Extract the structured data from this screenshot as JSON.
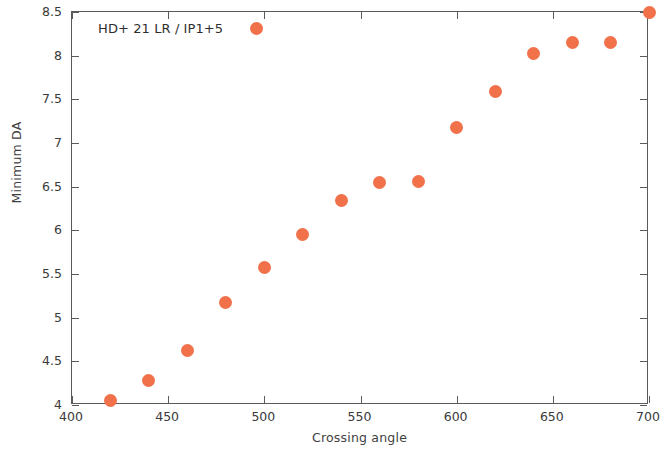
{
  "chart_data": {
    "type": "scatter",
    "title": "",
    "annotation": "HD+ 21 LR / IP1+5",
    "xlabel": "Crossing angle",
    "ylabel": "Minimum DA",
    "xlim": [
      400,
      700
    ],
    "ylim": [
      4,
      8.5
    ],
    "xticks": [
      400,
      450,
      500,
      550,
      600,
      650,
      700
    ],
    "xtick_labels": [
      "400",
      "450",
      "500",
      "550",
      "600",
      "650",
      "700"
    ],
    "yticks": [
      4,
      4.5,
      5,
      5.5,
      6,
      6.5,
      7,
      7.5,
      8,
      8.5
    ],
    "ytick_labels": [
      "4",
      "4.5",
      "5",
      "5.5",
      "6",
      "6.5",
      "7",
      "7.5",
      "8",
      "8.5"
    ],
    "grid": false,
    "legend": null,
    "marker_color": "#f0714a",
    "marker_shape": "circle",
    "x": [
      420,
      440,
      460,
      480,
      496,
      500,
      520,
      540,
      560,
      580,
      600,
      620,
      640,
      660,
      680,
      700
    ],
    "y": [
      4.05,
      4.28,
      4.62,
      5.17,
      8.31,
      5.58,
      5.95,
      6.34,
      6.55,
      6.56,
      7.18,
      7.59,
      8.02,
      8.15,
      8.15,
      8.49
    ]
  },
  "axes": {
    "frame_color": "#5a5a5a"
  }
}
